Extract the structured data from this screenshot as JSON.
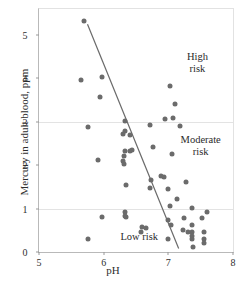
{
  "chart_data": {
    "type": "scatter",
    "title": "",
    "xlabel": "pH",
    "ylabel": "Mercury in adult blood, ppm",
    "xlim": [
      5,
      8
    ],
    "ylim": [
      0,
      5.6
    ],
    "xticks": [
      5,
      6,
      7,
      8
    ],
    "yticks": [
      0,
      1,
      2,
      3,
      4,
      5
    ],
    "xtick_labels": [
      "5",
      "6",
      "7",
      "8"
    ],
    "ytick_labels": [
      "0",
      "1",
      "2",
      "3",
      "4",
      "5"
    ],
    "grid": "horizontal gridlines at y=1 and y=3",
    "gridlines_y": [
      1,
      3
    ],
    "legend": "none",
    "point_color": "#6b6b6b",
    "line_color": "#6a6a6a",
    "annotations": [
      {
        "text": "High risk",
        "x": 7.45,
        "y": 4.35
      },
      {
        "text": "Moderate\nrisk",
        "x": 7.5,
        "y": 2.45
      },
      {
        "text": "Low risk",
        "x": 6.55,
        "y": 0.35
      }
    ],
    "trend_line": {
      "x": [
        5.75,
        7.16
      ],
      "y": [
        5.25,
        0.08
      ]
    },
    "points": [
      {
        "x": 5.7,
        "y": 5.33
      },
      {
        "x": 5.65,
        "y": 3.97
      },
      {
        "x": 5.97,
        "y": 4.04
      },
      {
        "x": 5.95,
        "y": 3.58
      },
      {
        "x": 5.75,
        "y": 2.89
      },
      {
        "x": 5.92,
        "y": 2.13
      },
      {
        "x": 5.97,
        "y": 0.81
      },
      {
        "x": 5.76,
        "y": 0.3
      },
      {
        "x": 6.33,
        "y": 3.01
      },
      {
        "x": 6.33,
        "y": 2.79
      },
      {
        "x": 6.3,
        "y": 2.72
      },
      {
        "x": 6.4,
        "y": 2.7
      },
      {
        "x": 6.33,
        "y": 2.32
      },
      {
        "x": 6.4,
        "y": 2.33
      },
      {
        "x": 6.44,
        "y": 2.34
      },
      {
        "x": 6.32,
        "y": 2.22
      },
      {
        "x": 6.3,
        "y": 2.1
      },
      {
        "x": 6.31,
        "y": 2.03
      },
      {
        "x": 6.34,
        "y": 1.54
      },
      {
        "x": 6.33,
        "y": 0.93
      },
      {
        "x": 6.33,
        "y": 0.84
      },
      {
        "x": 6.34,
        "y": 0.8
      },
      {
        "x": 6.6,
        "y": 0.57
      },
      {
        "x": 6.66,
        "y": 0.55
      },
      {
        "x": 6.58,
        "y": 0.47
      },
      {
        "x": 6.72,
        "y": 2.93
      },
      {
        "x": 6.76,
        "y": 2.43
      },
      {
        "x": 6.73,
        "y": 1.65
      },
      {
        "x": 6.72,
        "y": 1.47
      },
      {
        "x": 6.88,
        "y": 1.74
      },
      {
        "x": 6.94,
        "y": 1.73
      },
      {
        "x": 6.95,
        "y": 3.07
      },
      {
        "x": 7.03,
        "y": 3.82
      },
      {
        "x": 7.1,
        "y": 3.41
      },
      {
        "x": 7.07,
        "y": 3.08
      },
      {
        "x": 7.18,
        "y": 2.9
      },
      {
        "x": 7.06,
        "y": 2.25
      },
      {
        "x": 7.0,
        "y": 1.45
      },
      {
        "x": 7.03,
        "y": 1.05
      },
      {
        "x": 7.13,
        "y": 1.23
      },
      {
        "x": 6.99,
        "y": 0.74
      },
      {
        "x": 7.04,
        "y": 0.62
      },
      {
        "x": 6.99,
        "y": 0.3
      },
      {
        "x": 7.28,
        "y": 1.62
      },
      {
        "x": 7.24,
        "y": 0.79
      },
      {
        "x": 7.22,
        "y": 0.51
      },
      {
        "x": 7.3,
        "y": 0.47
      },
      {
        "x": 7.36,
        "y": 1.02
      },
      {
        "x": 7.36,
        "y": 0.62
      },
      {
        "x": 7.36,
        "y": 0.46
      },
      {
        "x": 7.36,
        "y": 0.36
      },
      {
        "x": 7.37,
        "y": 0.29
      },
      {
        "x": 7.38,
        "y": 0.11
      },
      {
        "x": 7.52,
        "y": 0.78
      },
      {
        "x": 7.55,
        "y": 0.45
      },
      {
        "x": 7.55,
        "y": 0.3
      },
      {
        "x": 7.55,
        "y": 0.21
      },
      {
        "x": 7.6,
        "y": 0.93
      }
    ]
  }
}
